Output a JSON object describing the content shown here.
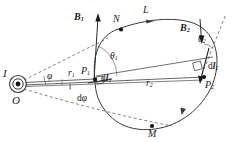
{
  "figure": {
    "background_color": "#ffffff",
    "stroke_color": "#333333",
    "label_color": "#1a1a1a"
  },
  "labels": {
    "current": "I",
    "origin": "O",
    "point_p1": "P",
    "point_p1_sub": "1",
    "point_p2": "P",
    "point_p2_sub": "2",
    "point_n": "N",
    "point_m": "M",
    "loop": "L",
    "field_b1": "B",
    "field_b1_sub": "1",
    "field_b2": "B",
    "field_b2_sub": "2",
    "radius_r1": "r",
    "radius_r1_sub": "1",
    "radius_r2": "r",
    "radius_r2_sub": "2",
    "angle_theta1": "θ",
    "angle_theta1_sub": "1",
    "angle_theta2": "θ",
    "angle_theta2_sub": "2",
    "angle_phi": "φ",
    "angle_dphi_d": "d",
    "angle_dphi_sym": "φ",
    "element_dl1_d": "d",
    "element_dl1_l": "l",
    "element_dl1_sub": "1",
    "element_dl2_d": "d",
    "element_dl2_l": "l",
    "element_dl2_sub": "2"
  },
  "geometry": {
    "source_center": [
      18,
      84
    ],
    "p1": [
      95,
      79
    ],
    "p2": [
      204,
      77
    ],
    "n": [
      118,
      30
    ],
    "m": [
      150,
      126
    ],
    "loop_type": "closed-curve",
    "arrow_direction_b1": "up",
    "arrow_direction_b2": "down",
    "current_symbol": "out-of-page"
  }
}
